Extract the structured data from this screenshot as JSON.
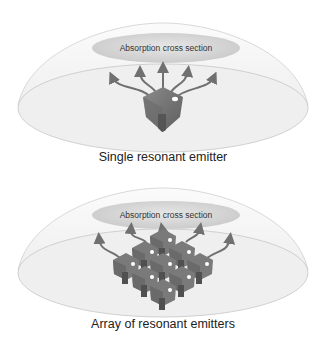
{
  "panels": [
    {
      "id": "single",
      "caption": "Single resonant emitter",
      "absorption_label": "Absorption cross section",
      "emitter_count": 1,
      "arrow_count": 5
    },
    {
      "id": "array",
      "caption": "Array of resonant emitters",
      "absorption_label": "Absorption cross section",
      "emitter_count": 9,
      "arrow_count": 5
    }
  ],
  "colors": {
    "dome_fill": "#f2f2f2",
    "dome_stroke": "#c8c8c8",
    "absorption_fill": "#d6d6d6",
    "emitter": "#777777",
    "arrow": "#707070"
  }
}
